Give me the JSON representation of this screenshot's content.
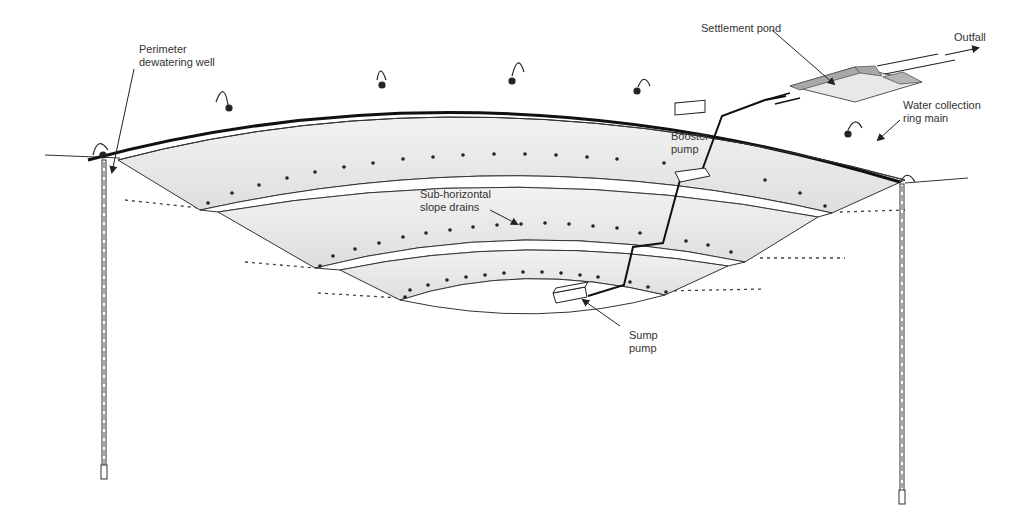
{
  "diagram": {
    "labels": {
      "perimeter_well_line1": "Perimeter",
      "perimeter_well_line2": "dewatering well",
      "settlement_pond": "Settlement pond",
      "outfall": "Outfall",
      "ring_main_line1": "Water collection",
      "ring_main_line2": "ring main",
      "booster_line1": "Booster",
      "booster_line2": "pump",
      "slope_drains_line1": "Sub-horizontal",
      "slope_drains_line2": "slope drains",
      "sump_line1": "Sump",
      "sump_line2": "pump"
    },
    "components": [
      {
        "name": "perimeter-dewatering-well-left"
      },
      {
        "name": "perimeter-dewatering-well-right"
      },
      {
        "name": "water-collection-ring-main"
      },
      {
        "name": "settlement-pond"
      },
      {
        "name": "outfall-pipe"
      },
      {
        "name": "booster-pump"
      },
      {
        "name": "sump-pump"
      },
      {
        "name": "sub-horizontal-slope-drains"
      },
      {
        "name": "pit-benches",
        "count": 3
      }
    ],
    "colors": {
      "pit_fill": "#e4e4e4",
      "bench_fill": "#ffffff",
      "line": "#222222",
      "pond_fill": "#e8e8e8",
      "pond_rim": "#a8a8a8",
      "text": "#333333"
    }
  }
}
